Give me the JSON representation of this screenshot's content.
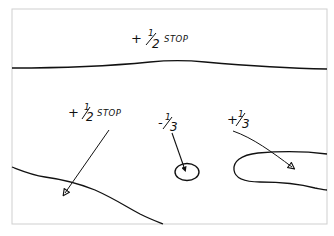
{
  "diagram": {
    "type": "dodge-burn exposure map",
    "frame_color": "#cfcfcf",
    "ink_color": "#111111",
    "regions": [
      {
        "id": "sky",
        "label": {
          "sign": "+",
          "numerator": "1",
          "denominator": "2",
          "suffix": "STOP"
        }
      },
      {
        "id": "lower-left-area",
        "label": {
          "sign": "+",
          "numerator": "1",
          "denominator": "2",
          "suffix": "STOP"
        }
      },
      {
        "id": "center-circle",
        "label": {
          "sign": "-",
          "numerator": "1",
          "denominator": "3",
          "suffix": ""
        }
      },
      {
        "id": "right-blob",
        "label": {
          "sign": "+",
          "numerator": "1",
          "denominator": "3",
          "suffix": ""
        }
      }
    ]
  }
}
